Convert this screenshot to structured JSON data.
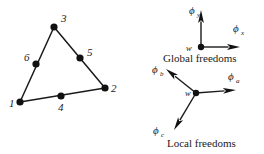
{
  "figure": {
    "background_color": "#ffffff",
    "ink_color": "#1a1a1a"
  },
  "element": {
    "name": "six-node-triangle",
    "nodes": [
      {
        "id": "1",
        "label": "1",
        "x": 20,
        "y": 102,
        "label_x": 9,
        "label_y": 107,
        "corner": true
      },
      {
        "id": "2",
        "label": "2",
        "x": 105,
        "y": 88,
        "label_x": 111,
        "label_y": 92,
        "corner": true
      },
      {
        "id": "3",
        "label": "3",
        "x": 54,
        "y": 27,
        "label_x": 61,
        "label_y": 22,
        "corner": true
      },
      {
        "id": "4",
        "label": "4",
        "x": 61,
        "y": 96,
        "label_x": 58,
        "label_y": 111,
        "corner": false
      },
      {
        "id": "5",
        "label": "5",
        "x": 80,
        "y": 58,
        "label_x": 87,
        "label_y": 56,
        "corner": false
      },
      {
        "id": "6",
        "label": "6",
        "x": 36,
        "y": 64,
        "label_x": 24,
        "label_y": 61,
        "corner": false
      }
    ],
    "edges": [
      {
        "from": "1",
        "to": "3"
      },
      {
        "from": "3",
        "to": "2"
      },
      {
        "from": "1",
        "to": "2"
      }
    ],
    "node_radius": 3.6
  },
  "global_freedoms": {
    "caption": "Global freedoms",
    "caption_x": 163,
    "caption_y": 62,
    "origin_label": "w",
    "origin_label_x": 186,
    "origin_label_y": 51,
    "origin_x": 201,
    "origin_y": 47,
    "node_radius": 3.2,
    "vectors": [
      {
        "name": "phi-y",
        "symbol": "ϕ",
        "subscript": "y",
        "label_x": 189,
        "label_y": 14,
        "sub_x": 197,
        "sub_y": 17,
        "tip_x": 201,
        "tip_y": 10,
        "angle_deg": 90
      },
      {
        "name": "phi-x",
        "symbol": "ϕ",
        "subscript": "x",
        "label_x": 233,
        "label_y": 32,
        "sub_x": 241,
        "sub_y": 35,
        "tip_x": 240,
        "tip_y": 47,
        "angle_deg": 0
      }
    ]
  },
  "local_freedoms": {
    "caption": "Local freedoms",
    "caption_x": 167,
    "caption_y": 147,
    "origin_label": "w",
    "origin_label_x": 185,
    "origin_label_y": 96,
    "origin_x": 196,
    "origin_y": 93,
    "node_radius": 3.2,
    "vectors": [
      {
        "name": "phi-a",
        "symbol": "ϕ",
        "subscript": "a",
        "label_x": 228,
        "label_y": 80,
        "sub_x": 236,
        "sub_y": 83,
        "tip_x": 236,
        "tip_y": 90,
        "angle_deg": -8
      },
      {
        "name": "phi-b",
        "symbol": "ϕ",
        "subscript": "b",
        "label_x": 152,
        "label_y": 73,
        "sub_x": 160,
        "sub_y": 76,
        "tip_x": 166,
        "tip_y": 69,
        "angle_deg": 143
      },
      {
        "name": "phi-c",
        "symbol": "ϕ",
        "subscript": "c",
        "label_x": 153,
        "label_y": 134,
        "sub_x": 161,
        "sub_y": 137,
        "tip_x": 174,
        "tip_y": 130,
        "angle_deg": -119
      }
    ]
  }
}
